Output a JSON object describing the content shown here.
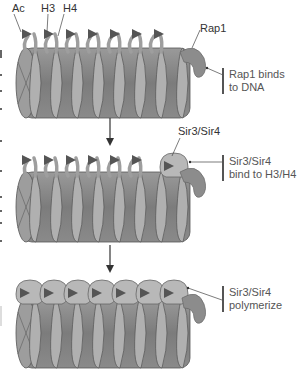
{
  "diagram": {
    "type": "chromatin-silencing-steps",
    "colors": {
      "coil": "#8f8f8f",
      "coil_dark": "#6a6a6a",
      "coil_light": "#b3b3b3",
      "tail": "#a8a8a8",
      "acetyl": "#555555",
      "rap1": "#8c8c8c",
      "sir": "#b9b9b9",
      "arrow": "#333333"
    },
    "labels": {
      "ac": "Ac",
      "h3": "H3",
      "h4": "H4",
      "rap1": "Rap1",
      "sir_top": "Sir3/Sir4"
    },
    "steps": [
      {
        "id": "step1",
        "callout_line1": "Rap1 binds",
        "callout_line2": "to DNA"
      },
      {
        "id": "step2",
        "callout_line1": "Sir3/Sir4",
        "callout_line2": "bind to H3/H4"
      },
      {
        "id": "step3",
        "callout_line1": "Sir3/Sir4",
        "callout_line2": "polymerize"
      }
    ],
    "nucleosome_count": 7
  }
}
